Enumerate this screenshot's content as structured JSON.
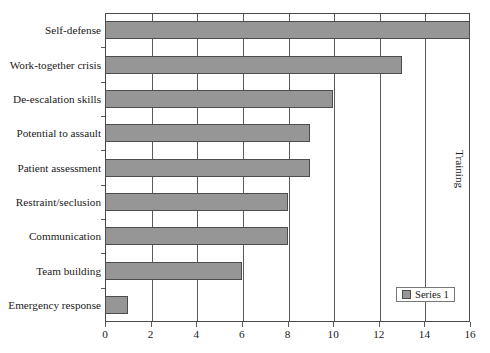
{
  "chart_data": {
    "type": "bar",
    "orientation": "horizontal",
    "title": "",
    "xlabel": "",
    "ylabel": "Training",
    "xlim": [
      0,
      16
    ],
    "xticks": [
      0,
      2,
      4,
      6,
      8,
      10,
      12,
      14,
      16
    ],
    "grid": "vertical",
    "legend": {
      "position": "inside-bottom-right",
      "entries": [
        "Series 1"
      ]
    },
    "categories": [
      "Self-defense",
      "Work-together crisis",
      "De-escalation skills",
      "Potential to assault",
      "Patient assessment",
      "Restraint/seclusion",
      "Communication",
      "Team building",
      "Emergency response"
    ],
    "series": [
      {
        "name": "Series 1",
        "color": "#969696",
        "values": [
          16,
          13,
          10,
          9,
          9,
          8,
          8,
          6,
          1
        ]
      }
    ]
  },
  "style": {
    "bar_fill": "#969696",
    "bar_border": "#4d4d4d",
    "axis_color": "#4a4a4a",
    "grid_color": "#5a5a5a",
    "background": "#ffffff"
  }
}
